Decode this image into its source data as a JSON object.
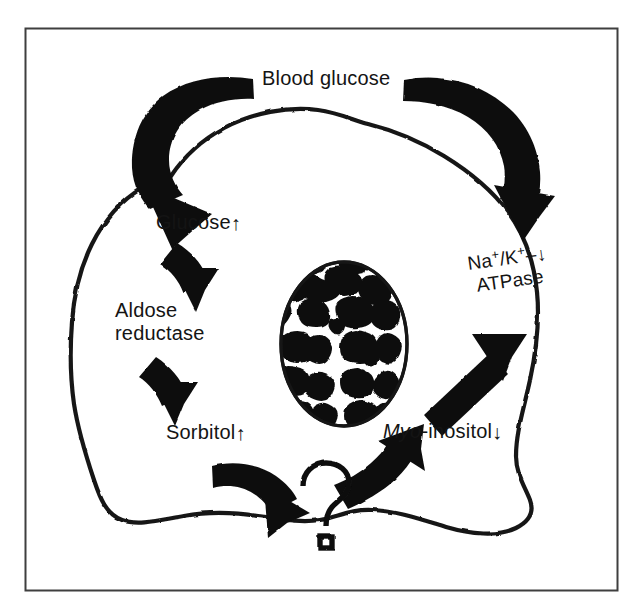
{
  "figure": {
    "background_color": "#ffffff",
    "ink_color": "#141414",
    "border_color": "#3a3a3a"
  },
  "labels": {
    "blood_glucose": "Blood glucose",
    "glucose": "Glucose",
    "glucose_trend": "↑",
    "aldose_line1": "Aldose",
    "aldose_line2": "reductase",
    "sorbitol": "Sorbitol",
    "sorbitol_trend": "↑",
    "question_mark": "?",
    "myo_italic": "Myo",
    "myo_rest": "-inositol",
    "myo_trend": "↓",
    "atpase_na": "Na",
    "atpase_na_sup": "+",
    "atpase_slash": "/K",
    "atpase_k_sup": "+",
    "atpase_dash": "–",
    "atpase_line2": "ATPase",
    "atpase_trend": "↓"
  },
  "graphics": {
    "frame": "rectangular-figure-border",
    "cell_membrane": "irregular-wavy-cell-outline",
    "nucleus": "mottled-chromatin-ellipse",
    "arrows": [
      {
        "name": "blood-glucose-to-glucose",
        "style": "thick-curved",
        "direction": "down-left"
      },
      {
        "name": "blood-glucose-to-atpase",
        "style": "thick-curved",
        "direction": "down-right"
      },
      {
        "name": "glucose-to-aldose-reductase",
        "style": "thick-curved",
        "direction": "down"
      },
      {
        "name": "aldose-reductase-to-sorbitol",
        "style": "thick-curved",
        "direction": "down"
      },
      {
        "name": "sorbitol-to-question",
        "style": "thick-curved",
        "direction": "right"
      },
      {
        "name": "question-to-myo-inositol",
        "style": "thick-curved",
        "direction": "up-right"
      },
      {
        "name": "myo-inositol-to-atpase",
        "style": "thick-straight",
        "direction": "up-right"
      }
    ]
  }
}
